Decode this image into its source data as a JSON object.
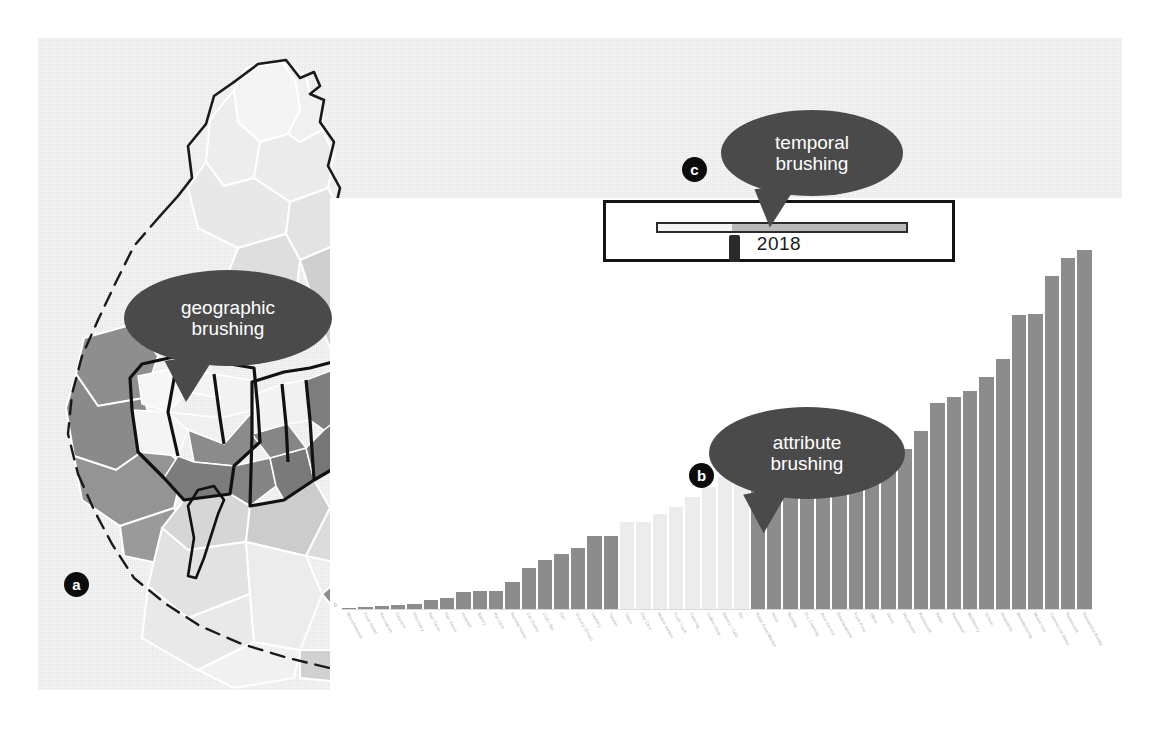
{
  "figure": {
    "background_color": "#ebebeb",
    "panel_color": "#ffffff"
  },
  "panels": [
    {
      "id": "a",
      "badge": "a",
      "name": "geographic-map"
    },
    {
      "id": "b",
      "badge": "b",
      "name": "attribute-bar-chart"
    },
    {
      "id": "c",
      "badge": "c",
      "name": "temporal-slider"
    }
  ],
  "callouts": {
    "geographic": {
      "line1": "geographic",
      "line2": "brushing",
      "fill": "#4a4a4a",
      "text_color": "#ffffff"
    },
    "attribute": {
      "line1": "attribute",
      "line2": "brushing",
      "fill": "#4a4a4a",
      "text_color": "#ffffff"
    },
    "temporal": {
      "line1": "temporal",
      "line2": "brushing",
      "fill": "#4a4a4a",
      "text_color": "#ffffff"
    }
  },
  "slider": {
    "value": "2018",
    "min_fraction": 0,
    "max_fraction": 1,
    "thumb_fraction": 0.3,
    "track_filled_color": "#b9b9b9",
    "track_empty_color": "#f4f4f4",
    "thumb_color": "#2a2a2a",
    "border_color": "#141414"
  },
  "map": {
    "selected_outline_color": "#111111",
    "region_shades": [
      "#f2f2f2",
      "#e6e6e6",
      "#d8d8d8",
      "#c9c9c9",
      "#b0b0b0",
      "#9a9a9a",
      "#8a8a8a",
      "#777777"
    ],
    "boundary_color": "#1a1a1a",
    "regions": [
      {
        "name": "far-northeast-1",
        "shade": "#f4f4f4",
        "selected": false
      },
      {
        "name": "far-northeast-2",
        "shade": "#f0f0f0",
        "selected": false
      },
      {
        "name": "northeast-1",
        "shade": "#ededed",
        "selected": false
      },
      {
        "name": "northeast-2",
        "shade": "#ebebeb",
        "selected": false
      },
      {
        "name": "northeast-3",
        "shade": "#e8e8e8",
        "selected": false
      },
      {
        "name": "north-1",
        "shade": "#e3e3e3",
        "selected": false
      },
      {
        "name": "north-2",
        "shade": "#dedede",
        "selected": false
      },
      {
        "name": "upper-north-corridor",
        "shade": "#cfcfcf",
        "selected": false
      },
      {
        "name": "west-1",
        "shade": "#8e8e8e",
        "selected": false
      },
      {
        "name": "west-2",
        "shade": "#8a8a8a",
        "selected": false
      },
      {
        "name": "west-3",
        "shade": "#949494",
        "selected": false
      },
      {
        "name": "center-ring-1",
        "shade": "#f6f6f6",
        "selected": true
      },
      {
        "name": "center-ring-2",
        "shade": "#f4f4f4",
        "selected": true
      },
      {
        "name": "center-ring-3",
        "shade": "#f2f2f2",
        "selected": true
      },
      {
        "name": "center-ring-4",
        "shade": "#f4f4f4",
        "selected": true
      },
      {
        "name": "center-core-1",
        "shade": "#8b8b8b",
        "selected": true
      },
      {
        "name": "center-core-2",
        "shade": "#7c7c7c",
        "selected": true
      },
      {
        "name": "center-core-3",
        "shade": "#848484",
        "selected": true
      },
      {
        "name": "center-core-4",
        "shade": "#7a7a7a",
        "selected": true
      },
      {
        "name": "center-east-1",
        "shade": "#f3f3f3",
        "selected": true
      },
      {
        "name": "center-east-2",
        "shade": "#f0f0f0",
        "selected": true
      },
      {
        "name": "center-east-3",
        "shade": "#7e7e7e",
        "selected": true
      },
      {
        "name": "center-east-4",
        "shade": "#767676",
        "selected": true
      },
      {
        "name": "riverfront-sliver",
        "shade": "#fafafa",
        "selected": true
      },
      {
        "name": "south-1",
        "shade": "#d6d6d6",
        "selected": false
      },
      {
        "name": "south-2",
        "shade": "#cccccc",
        "selected": false
      },
      {
        "name": "south-3",
        "shade": "#e2e2e2",
        "selected": false
      },
      {
        "name": "southwest-1",
        "shade": "#e9e9e9",
        "selected": false
      },
      {
        "name": "southwest-2",
        "shade": "#f1f1f1",
        "selected": false
      },
      {
        "name": "southeast-1",
        "shade": "#8f8f8f",
        "selected": false
      },
      {
        "name": "southeast-2",
        "shade": "#d0d0d0",
        "selected": false
      }
    ]
  },
  "chart_data": {
    "type": "bar",
    "title": "",
    "xlabel": "",
    "ylabel": "",
    "grid": false,
    "legend": null,
    "axis_zero_label": "0",
    "ylim": [
      0,
      100
    ],
    "bar_color": "#8c8c8c",
    "brushed_color": "#ececec",
    "brushed_range": [
      17,
      24
    ],
    "categories": [
      "Miscellaneous",
      "Food Stand",
      "Recreation",
      "Daycare",
      "Pharmacy",
      "Nail Salon",
      "Hair Salon",
      "Hospital",
      "Bakery",
      "Pet Care",
      "Nursing Home",
      "Car Dealer",
      "Club / Bar",
      "Deli",
      "Grocery (Small)",
      "Laundry",
      "Theater",
      "Tattoo",
      "Day Care",
      "Mobile Vendor",
      "Food Truck",
      "Catering",
      "Coffee Shop",
      "Bakery / Cafe",
      "Bar",
      "Retail Food Market",
      "Hotel",
      "Building",
      "Dry Cleaning",
      "Auto Service",
      "Entertainment",
      "Food Prep",
      "Office",
      "Salon",
      "Warehouse",
      "Restaurant",
      "Retail",
      "Residential",
      "Multifamily",
      "School",
      "Hospitality",
      "Manufacturing",
      "Mixed Use",
      "Commercial Retail",
      "Restaurant",
      "Residential Rental"
    ],
    "values": [
      0.6,
      0.8,
      1.0,
      1.3,
      1.6,
      2.4,
      3.0,
      4.6,
      4.8,
      4.9,
      7.0,
      10.5,
      12.5,
      14.0,
      15.5,
      18.5,
      18.7,
      22.0,
      22.2,
      24.0,
      26.0,
      28.5,
      31.0,
      33.5,
      35.5,
      38.0,
      38.2,
      38.5,
      39.0,
      39.2,
      39.5,
      39.8,
      40.0,
      40.2,
      40.5,
      45.0,
      52.0,
      53.5,
      55.0,
      58.5,
      63.0,
      74.0,
      74.5,
      84.0,
      88.5,
      90.5
    ]
  }
}
